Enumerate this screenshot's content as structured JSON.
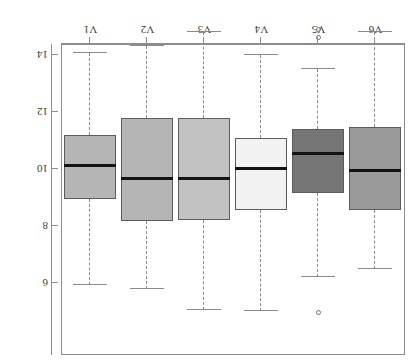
{
  "figure": {
    "title": "",
    "background": "#ffffff",
    "frame_color": "#8d8d8d",
    "rotation_degrees": 180
  },
  "chart_data": {
    "type": "box",
    "title": "",
    "xlabel": "",
    "ylabel": "",
    "orientation": "vertical",
    "categories": [
      "V1",
      "V2",
      "V3",
      "V4",
      "V5",
      "V6"
    ],
    "display_order_left_to_right": [
      "V6",
      "V5",
      "V4",
      "V3",
      "V2",
      "V1"
    ],
    "yticks": [
      6,
      8,
      10,
      12,
      14
    ],
    "ytick_labels": [
      "6",
      "8",
      "10",
      "12",
      "14"
    ],
    "ylim": [
      4.6,
      15.4
    ],
    "y_axis_inverted": true,
    "grid": false,
    "legend": null,
    "boxes": [
      {
        "name": "V6",
        "fill": "#9a9a9a",
        "whisker_low": 6.5,
        "q1": 8.56,
        "median": 9.96,
        "q3": 11.47,
        "whisker_high": 14.8,
        "outliers": []
      },
      {
        "name": "V5",
        "fill": "#767676",
        "whisker_low": 6.2,
        "q1": 9.16,
        "median": 10.56,
        "q3": 11.4,
        "whisker_high": 13.5,
        "outliers": [
          4.95,
          14.6,
          14.9
        ]
      },
      {
        "name": "V4",
        "fill": "#f2f2f2",
        "whisker_low": 5.0,
        "q1": 8.56,
        "median": 10.0,
        "q3": 11.1,
        "whisker_high": 14.0,
        "outliers": []
      },
      {
        "name": "V3",
        "fill": "#c2c2c2",
        "whisker_low": 5.07,
        "q1": 8.2,
        "median": 9.68,
        "q3": 11.8,
        "whisker_high": 14.8,
        "outliers": []
      },
      {
        "name": "V2",
        "fill": "#b5b5b5",
        "whisker_low": 5.8,
        "q1": 8.17,
        "median": 9.65,
        "q3": 11.8,
        "whisker_high": 14.3,
        "outliers": []
      },
      {
        "name": "V1",
        "fill": "#b5b5b5",
        "whisker_low": 5.93,
        "q1": 8.95,
        "median": 10.14,
        "q3": 11.2,
        "whisker_high": 14.07,
        "outliers": []
      }
    ]
  }
}
